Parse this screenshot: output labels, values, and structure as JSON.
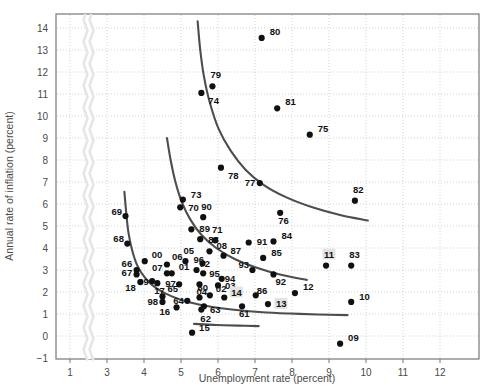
{
  "chart_data": {
    "type": "scatter",
    "title": "",
    "xlabel": "Unemployment rate (percent)",
    "ylabel": "Annual rate of inflation (percent)",
    "xlim": [
      0.3,
      12.9
    ],
    "ylim": [
      -1,
      14.6
    ],
    "xticks": [
      1,
      3,
      4,
      5,
      6,
      7,
      8,
      9,
      10,
      11,
      12
    ],
    "yticks": [
      -1,
      0,
      1,
      2,
      3,
      4,
      5,
      6,
      7,
      8,
      9,
      10,
      11,
      12,
      13,
      14
    ],
    "grid": true,
    "legend": "none",
    "axis_break": {
      "between": [
        1,
        3
      ],
      "style": "wavy"
    },
    "point_color": "#111111",
    "curve_color": "#4d4d4d",
    "highlighted_labels": [
      "11",
      "13",
      "14"
    ],
    "points": [
      {
        "label": "80",
        "x": 7.18,
        "y": 13.55,
        "lx": 8,
        "ly": -3
      },
      {
        "label": "79",
        "x": 5.85,
        "y": 11.35,
        "lx": -2,
        "ly": -8
      },
      {
        "label": "74",
        "x": 5.55,
        "y": 11.05,
        "lx": 0,
        "ly": 11
      },
      {
        "label": "81",
        "x": 7.6,
        "y": 10.35,
        "lx": 8,
        "ly": -3
      },
      {
        "label": "75",
        "x": 8.48,
        "y": 9.15,
        "lx": 8,
        "ly": -3
      },
      {
        "label": "78",
        "x": 6.08,
        "y": 7.65,
        "lx": 0,
        "ly": 11
      },
      {
        "label": "77",
        "x": 7.13,
        "y": 6.95,
        "lx": -15,
        "ly": 3
      },
      {
        "label": "82",
        "x": 9.7,
        "y": 6.15,
        "lx": -2,
        "ly": -8
      },
      {
        "label": "73",
        "x": 5.05,
        "y": 6.2,
        "lx": 8,
        "ly": -2
      },
      {
        "label": "70",
        "x": 4.98,
        "y": 5.85,
        "lx": 8,
        "ly": 4
      },
      {
        "label": "90",
        "x": 5.6,
        "y": 5.4,
        "lx": -2,
        "ly": -7
      },
      {
        "label": "69",
        "x": 3.5,
        "y": 5.45,
        "lx": -14,
        "ly": -1
      },
      {
        "label": "76",
        "x": 7.68,
        "y": 5.6,
        "lx": -2,
        "ly": 11
      },
      {
        "label": "89",
        "x": 5.28,
        "y": 4.85,
        "lx": 8,
        "ly": 3
      },
      {
        "label": "88",
        "x": 5.52,
        "y": 4.4,
        "lx": 8,
        "ly": 4
      },
      {
        "label": "71",
        "x": 5.92,
        "y": 4.35,
        "lx": -3,
        "ly": -7
      },
      {
        "label": "68",
        "x": 3.55,
        "y": 4.2,
        "lx": -14,
        "ly": -2
      },
      {
        "label": "08",
        "x": 5.77,
        "y": 3.85,
        "lx": 7,
        "ly": -2
      },
      {
        "label": "91",
        "x": 6.83,
        "y": 4.25,
        "lx": 8,
        "ly": 2
      },
      {
        "label": "84",
        "x": 7.5,
        "y": 4.3,
        "lx": 8,
        "ly": -2
      },
      {
        "label": "87",
        "x": 6.15,
        "y": 3.65,
        "lx": 7,
        "ly": -2
      },
      {
        "label": "05",
        "x": 5.12,
        "y": 3.4,
        "lx": -2,
        "ly": -7
      },
      {
        "label": "85",
        "x": 7.22,
        "y": 3.55,
        "lx": 8,
        "ly": -2
      },
      {
        "label": "72",
        "x": 5.58,
        "y": 3.3,
        "lx": -3,
        "ly": 4
      },
      {
        "label": "96",
        "x": 5.42,
        "y": 3.0,
        "lx": -3,
        "ly": -7
      },
      {
        "label": "06",
        "x": 4.62,
        "y": 3.25,
        "lx": 5,
        "ly": -5
      },
      {
        "label": "00",
        "x": 4.02,
        "y": 3.4,
        "lx": 7,
        "ly": -3
      },
      {
        "label": "93",
        "x": 6.93,
        "y": 3.0,
        "lx": -14,
        "ly": -2
      },
      {
        "label": "95",
        "x": 5.6,
        "y": 2.85,
        "lx": 6,
        "ly": 4
      },
      {
        "label": "94",
        "x": 6.1,
        "y": 2.6,
        "lx": 3,
        "ly": 3
      },
      {
        "label": "01",
        "x": 4.75,
        "y": 2.85,
        "lx": 7,
        "ly": 0
      },
      {
        "label": "07",
        "x": 4.62,
        "y": 2.85,
        "lx": -15,
        "ly": -2
      },
      {
        "label": "66",
        "x": 3.8,
        "y": 3.0,
        "lx": -15,
        "ly": -3
      },
      {
        "label": "67",
        "x": 3.8,
        "y": 2.8,
        "lx": -15,
        "ly": 2
      },
      {
        "label": "92",
        "x": 7.5,
        "y": 2.8,
        "lx": 2,
        "ly": 11
      },
      {
        "label": "03",
        "x": 6.0,
        "y": 2.3,
        "lx": 7,
        "ly": 4
      },
      {
        "label": "97",
        "x": 4.95,
        "y": 2.35,
        "lx": -14,
        "ly": 3
      },
      {
        "label": "04",
        "x": 5.5,
        "y": 2.35,
        "lx": -3,
        "ly": 11
      },
      {
        "label": "17",
        "x": 4.36,
        "y": 2.4,
        "lx": -3,
        "ly": 11
      },
      {
        "label": "99",
        "x": 4.22,
        "y": 2.5,
        "lx": -14,
        "ly": 4
      },
      {
        "label": "18",
        "x": 3.9,
        "y": 2.45,
        "lx": -15,
        "ly": 9
      },
      {
        "label": "02",
        "x": 5.78,
        "y": 1.85,
        "lx": 6,
        "ly": -3
      },
      {
        "label": "14",
        "x": 6.17,
        "y": 1.75,
        "lx": 7,
        "ly": -2
      },
      {
        "label": "12",
        "x": 8.08,
        "y": 1.95,
        "lx": 8,
        "ly": -3
      },
      {
        "label": "60",
        "x": 5.5,
        "y": 1.75,
        "lx": -2,
        "ly": -7
      },
      {
        "label": "64",
        "x": 5.17,
        "y": 1.6,
        "lx": -14,
        "ly": 3
      },
      {
        "label": "65",
        "x": 4.5,
        "y": 1.8,
        "lx": 5,
        "ly": -4
      },
      {
        "label": "98",
        "x": 4.5,
        "y": 1.55,
        "lx": -15,
        "ly": 3
      },
      {
        "label": "63",
        "x": 5.62,
        "y": 1.35,
        "lx": 6,
        "ly": 7
      },
      {
        "label": "62",
        "x": 5.55,
        "y": 1.2,
        "lx": -1,
        "ly": 12
      },
      {
        "label": "16",
        "x": 4.88,
        "y": 1.3,
        "lx": -17,
        "ly": 8
      },
      {
        "label": "61",
        "x": 6.65,
        "y": 1.35,
        "lx": -3,
        "ly": 11
      },
      {
        "label": "86",
        "x": 7.02,
        "y": 1.85,
        "lx": 1,
        "ly": -1
      },
      {
        "label": "13",
        "x": 7.35,
        "y": 1.45,
        "lx": 8,
        "ly": 3
      },
      {
        "label": "10",
        "x": 9.6,
        "y": 1.55,
        "lx": 8,
        "ly": -2
      },
      {
        "label": "83",
        "x": 9.6,
        "y": 3.2,
        "lx": -2,
        "ly": -8
      },
      {
        "label": "11",
        "x": 8.92,
        "y": 3.2,
        "lx": -2,
        "ly": -8
      },
      {
        "label": "15",
        "x": 5.3,
        "y": 0.15,
        "lx": 7,
        "ly": -2
      },
      {
        "label": "09",
        "x": 9.3,
        "y": -0.35,
        "lx": 8,
        "ly": 0
      }
    ],
    "curves": [
      {
        "name": "phillips-curve-1970s",
        "points": [
          [
            5.45,
            14.3
          ],
          [
            5.52,
            13.0
          ],
          [
            5.62,
            11.8
          ],
          [
            5.78,
            10.6
          ],
          [
            6.02,
            9.4
          ],
          [
            6.35,
            8.4
          ],
          [
            6.75,
            7.55
          ],
          [
            7.25,
            6.85
          ],
          [
            7.85,
            6.3
          ],
          [
            8.55,
            5.85
          ],
          [
            9.3,
            5.5
          ],
          [
            10.05,
            5.25
          ]
        ]
      },
      {
        "name": "phillips-curve-1960s-70s-mid",
        "points": [
          [
            4.62,
            9.0
          ],
          [
            4.72,
            8.0
          ],
          [
            4.85,
            7.0
          ],
          [
            5.02,
            6.1
          ],
          [
            5.25,
            5.3
          ],
          [
            5.55,
            4.6
          ],
          [
            5.95,
            4.0
          ],
          [
            6.45,
            3.5
          ],
          [
            7.05,
            3.1
          ],
          [
            7.7,
            2.78
          ],
          [
            8.4,
            2.55
          ]
        ]
      },
      {
        "name": "phillips-curve-early",
        "points": [
          [
            3.47,
            6.55
          ],
          [
            3.52,
            5.6
          ],
          [
            3.58,
            4.7
          ],
          [
            3.68,
            3.9
          ],
          [
            3.82,
            3.2
          ],
          [
            4.05,
            2.6
          ],
          [
            4.35,
            2.15
          ],
          [
            4.75,
            1.8
          ],
          [
            5.25,
            1.52
          ],
          [
            5.85,
            1.32
          ],
          [
            6.5,
            1.18
          ],
          [
            7.2,
            1.08
          ],
          [
            7.95,
            1.02
          ],
          [
            8.7,
            0.98
          ],
          [
            9.5,
            0.95
          ]
        ]
      },
      {
        "name": "phillips-curve-lowest-segment",
        "points": [
          [
            5.35,
            0.55
          ],
          [
            5.95,
            0.5
          ],
          [
            6.55,
            0.47
          ],
          [
            7.1,
            0.45
          ]
        ]
      }
    ]
  }
}
